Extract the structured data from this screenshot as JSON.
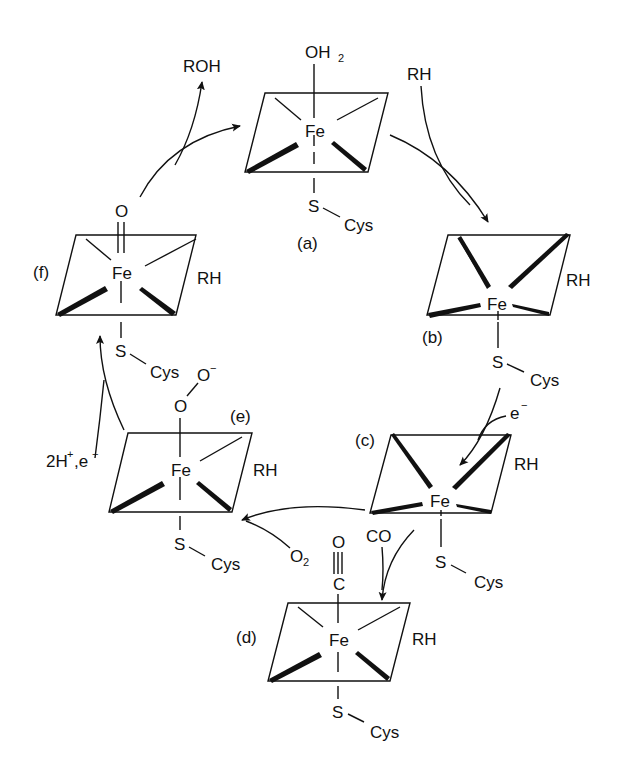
{
  "diagram": {
    "type": "catalytic-cycle",
    "colors": {
      "ink": "#111111",
      "background": "#ffffff"
    },
    "states": [
      {
        "id": "a",
        "label": "(a)",
        "metal": "Fe",
        "axial_top": "OH",
        "axial_top_sub": "2",
        "axial_bottom": "S",
        "thiolate": "Cys",
        "substrate": ""
      },
      {
        "id": "b",
        "label": "(b)",
        "metal": "Fe",
        "axial_top": "",
        "axial_bottom": "S",
        "thiolate": "Cys",
        "substrate": "RH"
      },
      {
        "id": "c",
        "label": "(c)",
        "metal": "Fe",
        "axial_top": "",
        "axial_bottom": "S",
        "thiolate": "Cys",
        "substrate": "RH"
      },
      {
        "id": "d",
        "label": "(d)",
        "metal": "Fe",
        "axial_top": "O",
        "axial_top_mid": "C",
        "axial_bottom": "S",
        "thiolate": "Cys",
        "substrate": "RH"
      },
      {
        "id": "e",
        "label": "(e)",
        "metal": "Fe",
        "axial_top": "O",
        "axial_top_2": "O",
        "axial_top_2_charge": "−",
        "axial_bottom": "S",
        "thiolate": "Cys",
        "substrate": "RH"
      },
      {
        "id": "f",
        "label": "(f)",
        "metal": "Fe",
        "axial_top": "O",
        "axial_bottom": "S",
        "thiolate": "Cys",
        "substrate": "RH"
      }
    ],
    "reagents": {
      "rh_in": "RH",
      "electron_1": "e",
      "electron_1_charge": "−",
      "co": "CO",
      "o2": "O",
      "o2_sub": "2",
      "protons_electron": "2H",
      "protons_charge": "+",
      "protons_sep": ",e",
      "protons_e_charge": "−",
      "roh_out": "ROH"
    }
  }
}
